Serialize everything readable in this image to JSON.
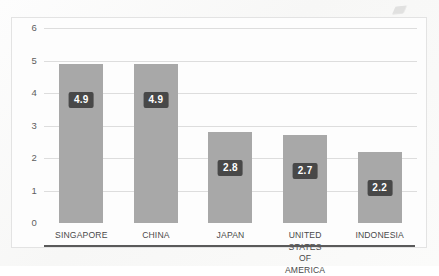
{
  "chart_data": {
    "type": "bar",
    "title": "",
    "subtitle": "",
    "xlabel": "",
    "ylabel": "",
    "categories": [
      "SINGAPORE",
      "CHINA",
      "JAPAN",
      "UNITED STATES\nOF AMERICA",
      "INDONESIA"
    ],
    "values": [
      4.9,
      4.9,
      2.8,
      2.7,
      2.2
    ],
    "data_labels": [
      "4.9",
      "4.9",
      "2.8",
      "2.7",
      "2.2"
    ],
    "ylim": [
      0,
      6
    ],
    "y_ticks": [
      0,
      1,
      2,
      3,
      4,
      5,
      6
    ],
    "y_tick_labels": [
      "0",
      "1",
      "2",
      "3",
      "4",
      "5",
      "6"
    ],
    "grid": true,
    "grid_axis": "y",
    "legend": false,
    "legend_position": "none",
    "series": [
      {
        "name": "",
        "values": [
          4.9,
          4.9,
          2.8,
          2.7,
          2.2
        ]
      }
    ]
  },
  "style": {
    "bar_color": "#a8a8a8",
    "label_box_color": "#484848",
    "label_text_color": "#ffffff",
    "gridline_color": "#dddddd",
    "axis_line_color": "#5a5a5a",
    "tick_text_color": "#5d5d5d",
    "category_text_color": "#4a4a4a",
    "frame_border_color": "#e3e3e3",
    "plot_background": "#fdfdfd"
  }
}
